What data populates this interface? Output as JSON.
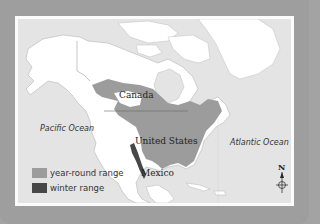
{
  "map": {
    "labels": {
      "canada": "Canada",
      "united_states": "United States",
      "mexico": "Mexico",
      "pacific_ocean": "Pacific Ocean",
      "atlantic_ocean": "Atlantic Ocean"
    },
    "legend": [
      {
        "label": "year-round range",
        "color": "#9c9c9c"
      },
      {
        "label": "winter range",
        "color": "#474747"
      }
    ],
    "compass": {
      "north_label": "N"
    },
    "colors": {
      "border": "#9e9e9e",
      "frame": "#fbfbfb",
      "ocean": "#e4e4e4",
      "land": "#ffffff",
      "year_round_range": "#9c9c9c",
      "winter_range": "#474747"
    }
  }
}
